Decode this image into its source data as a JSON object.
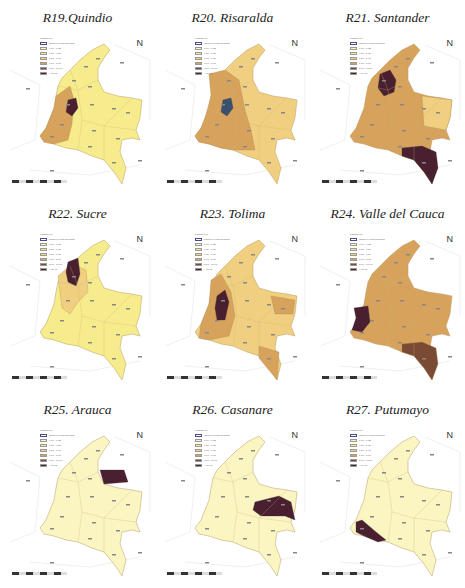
{
  "figure": {
    "legend": {
      "title": "Legend (%)",
      "items": [
        {
          "label": "Origin of Final Demand",
          "color": "#ffffff",
          "outline": "#4a4a8a"
        },
        {
          "label": "0.00 - 0.25",
          "color": "#fbf5c2"
        },
        {
          "label": "0.26 - 0.50",
          "color": "#f6ec8c"
        },
        {
          "label": "0.51 - 1.00",
          "color": "#f0cf80"
        },
        {
          "label": "1.01 - 5.00",
          "color": "#d6a25c"
        },
        {
          "label": "5.01 - 10.00",
          "color": "#7a4a34"
        },
        {
          "label": "> 10.01",
          "color": "#4a2030"
        }
      ]
    },
    "north_arrow": "N",
    "panels": [
      {
        "id": "R19",
        "title": "R19.Quindio",
        "base": "#f6ec8c",
        "mid": "#d6a25c",
        "hot": "#4a2030",
        "hot_region": "center-west-small",
        "mid_region": "west"
      },
      {
        "id": "R20",
        "title": "R20. Risaralda",
        "base": "#f0cf80",
        "mid": "#d6a25c",
        "hot": "#3a5070",
        "hot_region": "center-west-small",
        "mid_region": "west-center"
      },
      {
        "id": "R21",
        "title": "R21. Santander",
        "base": "#d6a25c",
        "mid": "#f0cf80",
        "hot": "#4a2030",
        "hot_region": "north-center",
        "mid_region": "east-vichada",
        "hot2_region": "south-amazonas"
      },
      {
        "id": "R22",
        "title": "R22. Sucre",
        "base": "#f6ec8c",
        "mid": "#f0cf80",
        "hot": "#4a2030",
        "hot_region": "north-caribbean",
        "mid_region": "north-west"
      },
      {
        "id": "R23",
        "title": "R23. Tolima",
        "base": "#f0cf80",
        "mid": "#d6a25c",
        "hot": "#4a2030",
        "hot_region": "center",
        "mid_region": "west-east"
      },
      {
        "id": "R24",
        "title": "R24. Valle del Cauca",
        "base": "#d6a25c",
        "mid": "#7a4a34",
        "hot": "#4a2030",
        "hot_region": "west-pacific",
        "mid_region": "south-amazonas"
      },
      {
        "id": "R25",
        "title": "R25. Arauca",
        "base": "#fbf5c2",
        "mid": "#fbf5c2",
        "hot": "#4a2030",
        "hot_region": "north-east-arauca",
        "mid_region": "none"
      },
      {
        "id": "R26",
        "title": "R26. Casanare",
        "base": "#fbf5c2",
        "mid": "#fbf5c2",
        "hot": "#4a2030",
        "hot_region": "east-casanare",
        "mid_region": "none"
      },
      {
        "id": "R27",
        "title": "R27. Putumayo",
        "base": "#fbf5c2",
        "mid": "#fbf5c2",
        "hot": "#4a2030",
        "hot_region": "south-west-putumayo",
        "mid_region": "none"
      }
    ]
  }
}
